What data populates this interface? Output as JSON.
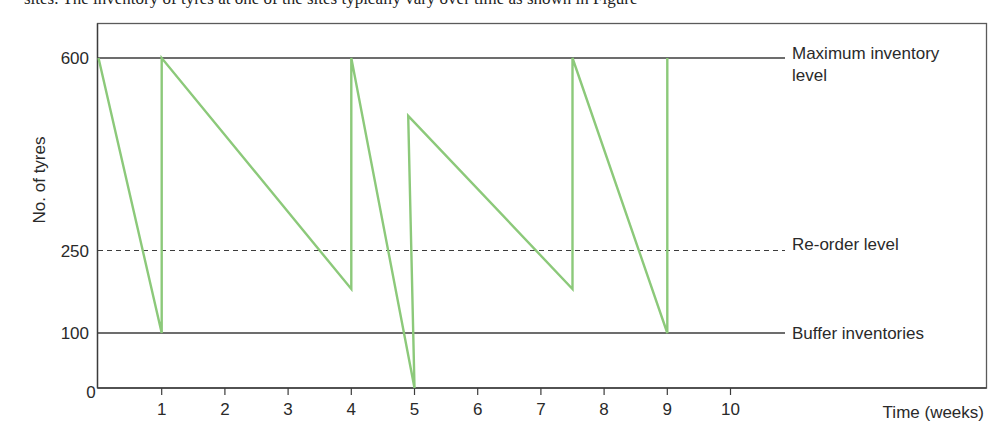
{
  "page": {
    "clipped_caption": "sites. The inventory of tyres at one of the sites typically vary over time as shown in Figure"
  },
  "chart_data": {
    "type": "line",
    "title": "",
    "xlabel": "Time (weeks)",
    "ylabel": "No. of tyres",
    "xlim": [
      0,
      13.9
    ],
    "ylim": [
      0,
      600
    ],
    "x_ticks": [
      1,
      2,
      3,
      4,
      5,
      6,
      7,
      8,
      9,
      10
    ],
    "x_tick_labels": [
      "1",
      "2",
      "3",
      "4",
      "5",
      "6",
      "7",
      "8",
      "9",
      "10"
    ],
    "origin_label": "0",
    "y_ticks": [
      0,
      100,
      250,
      600
    ],
    "y_tick_labels": [
      "0",
      "100",
      "250",
      "600"
    ],
    "grid": false,
    "series": [
      {
        "name": "Inventory level",
        "color": "#8cc97a",
        "points": [
          [
            0,
            600
          ],
          [
            1,
            100
          ],
          [
            1,
            600
          ],
          [
            4,
            180
          ],
          [
            4,
            600
          ],
          [
            5,
            0
          ],
          [
            4.9,
            495
          ],
          [
            7.5,
            180
          ],
          [
            7.5,
            600
          ],
          [
            9,
            100
          ],
          [
            9,
            600
          ]
        ]
      }
    ],
    "reference_lines": [
      {
        "name": "Maximum inventory level",
        "value": 600,
        "style": "solid",
        "label_line1": "Maximum inventory",
        "label_line2": "level"
      },
      {
        "name": "Re-order level",
        "value": 250,
        "style": "dashed",
        "label_line1": "Re-order level"
      },
      {
        "name": "Buffer inventories",
        "value": 100,
        "style": "solid",
        "label_line1": "Buffer inventories"
      }
    ],
    "legend_position": "right (inline labels)"
  }
}
